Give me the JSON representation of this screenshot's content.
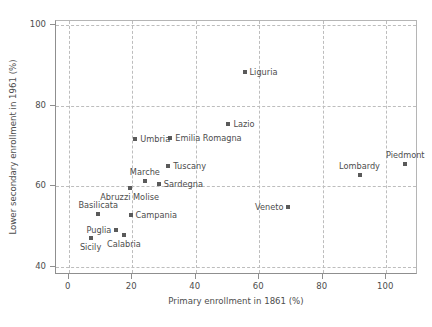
{
  "chart_data": {
    "type": "scatter",
    "title": "",
    "xlabel": "Primary enrollment in 1861 (%)",
    "ylabel": "Lower secondary enrollment in 1961 (%)",
    "xlim": [
      -4,
      110
    ],
    "ylim": [
      38,
      101
    ],
    "xticks": [
      0,
      20,
      40,
      60,
      80,
      100
    ],
    "yticks": [
      40,
      60,
      80,
      100
    ],
    "xtick_labels": [
      "0",
      "20",
      "40",
      "60",
      "80",
      "100"
    ],
    "ytick_labels": [
      "40",
      "60",
      "80",
      "100"
    ],
    "grid": true,
    "grid_style": "dashed",
    "legend": "none",
    "marker": "square",
    "marker_color": "#5a5a5a",
    "points": [
      {
        "label": "Liguria",
        "x": 55.7,
        "y": 88.2,
        "label_pos": "right"
      },
      {
        "label": "Lazio",
        "x": 50.6,
        "y": 75.3,
        "label_pos": "right"
      },
      {
        "label": "Emilia Romagna",
        "x": 32.3,
        "y": 71.7,
        "label_pos": "right"
      },
      {
        "label": "Umbria",
        "x": 21.3,
        "y": 71.4,
        "label_pos": "right"
      },
      {
        "label": "Tuscany",
        "x": 31.7,
        "y": 64.9,
        "label_pos": "right"
      },
      {
        "label": "Piedmont",
        "x": 106.3,
        "y": 65.4,
        "label_pos": "above"
      },
      {
        "label": "Lombardy",
        "x": 91.9,
        "y": 62.6,
        "label_pos": "above"
      },
      {
        "label": "Marche",
        "x": 24.3,
        "y": 61.1,
        "label_pos": "above"
      },
      {
        "label": "Sardegna",
        "x": 28.7,
        "y": 60.4,
        "label_pos": "right"
      },
      {
        "label": "Abruzzi Molise",
        "x": 19.5,
        "y": 59.4,
        "label_pos": "below"
      },
      {
        "label": "Veneto",
        "x": 69.5,
        "y": 54.6,
        "label_pos": "left"
      },
      {
        "label": "Campania",
        "x": 19.8,
        "y": 52.7,
        "label_pos": "right"
      },
      {
        "label": "Basilicata",
        "x": 9.6,
        "y": 52.9,
        "label_pos": "above"
      },
      {
        "label": "Puglia",
        "x": 15.3,
        "y": 48.9,
        "label_pos": "left"
      },
      {
        "label": "Calabria",
        "x": 17.7,
        "y": 47.7,
        "label_pos": "below"
      },
      {
        "label": "Sicily",
        "x": 7.2,
        "y": 47.0,
        "label_pos": "below"
      }
    ]
  }
}
